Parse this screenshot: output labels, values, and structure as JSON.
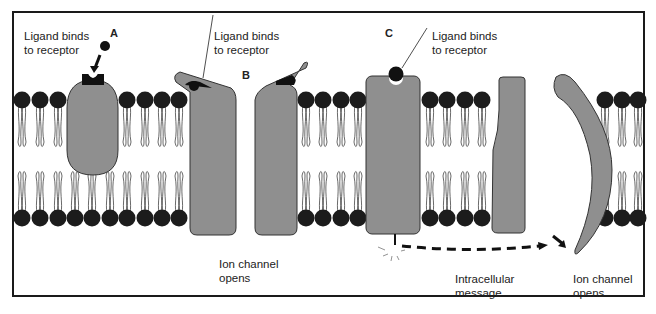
{
  "diagram": {
    "panels": [
      {
        "id": "A",
        "letter": "A",
        "label_line1": "Ligand binds",
        "label_line2": "to receptor"
      },
      {
        "id": "B",
        "letter": "B",
        "label_line1": "Ligand binds",
        "label_line2": "to receptor",
        "bottom_line1": "Ion channel",
        "bottom_line2": "opens"
      },
      {
        "id": "C",
        "letter": "C",
        "label_line1": "Ligand binds",
        "label_line2": "to receptor",
        "message_line1": "Intracellular",
        "message_line2": "message",
        "bottom_line1": "Ion channel",
        "bottom_line2": "opens"
      }
    ],
    "colors": {
      "protein_fill": "#8f8f8f",
      "protein_stroke": "#333333",
      "lipid_head": "#1c1c1c",
      "frame": "#1a1a1a"
    }
  }
}
